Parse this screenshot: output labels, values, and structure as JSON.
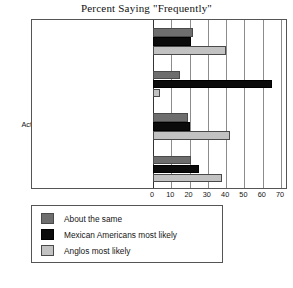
{
  "chart_data": {
    "type": "bar",
    "orientation": "horizontal",
    "title": "Percent Saying \"Frequently\"",
    "xlabel": "",
    "ylabel": "",
    "xlim": [
      0,
      70
    ],
    "xticks": [
      0,
      10,
      20,
      30,
      40,
      50,
      60,
      70
    ],
    "grid": true,
    "legend_position": "below",
    "categories": [
      "Have many stereotypes of Mexico",
      "Have same-class Mexicans in home",
      "Act superior to Mexicans of same class",
      "Prejudiced remarks about Mexico"
    ],
    "series": [
      {
        "name": "About the same",
        "color": "#6e6e6e",
        "values": [
          22,
          15,
          19,
          21
        ]
      },
      {
        "name": "Mexican Americans most likely",
        "color": "#0b0b0b",
        "values": [
          21,
          65,
          20,
          25
        ]
      },
      {
        "name": "Anglos most likely",
        "color": "#c2c2c2",
        "values": [
          40,
          4,
          42,
          38
        ]
      }
    ]
  },
  "legend": {
    "items": [
      {
        "label": "About the same"
      },
      {
        "label": "Mexican Americans most likely"
      },
      {
        "label": "Anglos most likely"
      }
    ]
  }
}
